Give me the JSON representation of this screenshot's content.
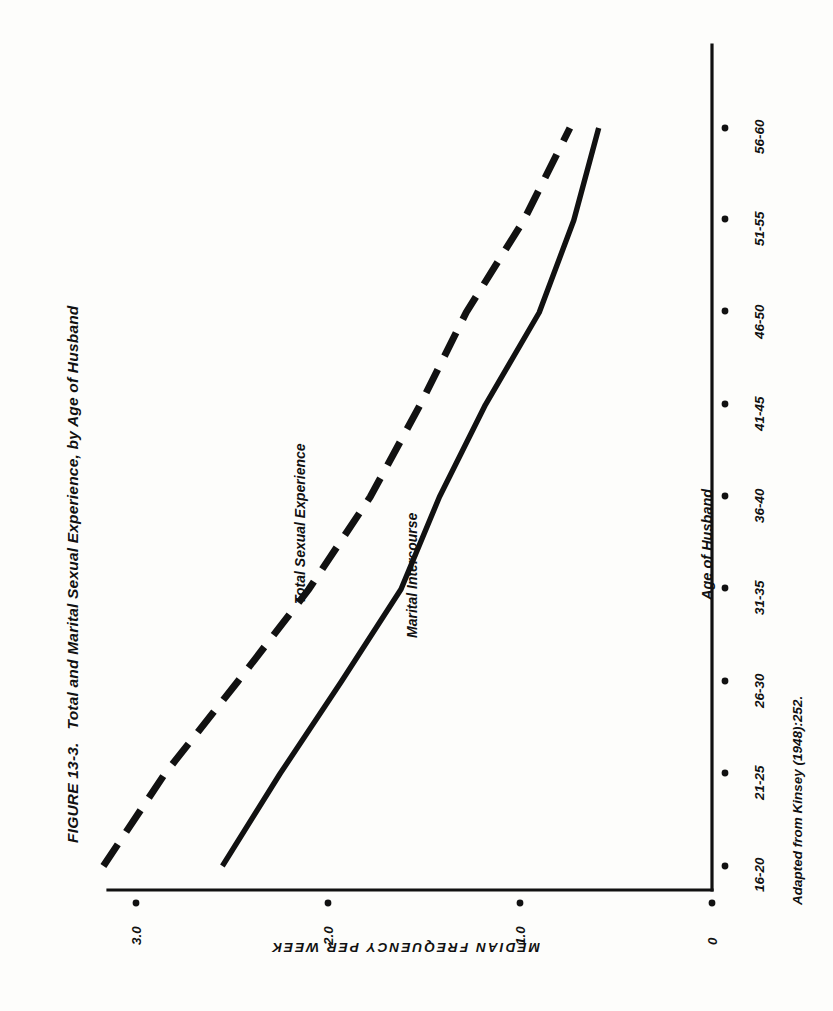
{
  "figure": {
    "number": "FIGURE 13-3.",
    "title": "Total and Marital Sexual Experience, by Age of Husband",
    "source_note": "Adapted from Kinsey (1948):252."
  },
  "axes": {
    "x_title": "Age of Husband",
    "y_title": "MEDIAN FREQUENCY PER WEEK",
    "y_ticks": [
      "0",
      "1.0",
      "2.0",
      "3.0"
    ],
    "x_ticks": [
      "16-20",
      "21-25",
      "26-30",
      "31-35",
      "36-40",
      "41-45",
      "46-50",
      "51-55",
      "56-60"
    ]
  },
  "series_labels": {
    "total": "Total Sexual Experience",
    "marital": "Marital Intercourse"
  },
  "colors": {
    "ink": "#111111",
    "paper": "#fdfdfb"
  },
  "chart_data": {
    "type": "line",
    "title": "Total and Marital Sexual Experience, by Age of Husband",
    "xlabel": "Age of Husband",
    "ylabel": "MEDIAN FREQUENCY PER WEEK",
    "categories": [
      "16-20",
      "21-25",
      "26-30",
      "31-35",
      "36-40",
      "41-45",
      "46-50",
      "51-55",
      "56-60"
    ],
    "ylim": [
      0,
      3.4
    ],
    "yticks": [
      0,
      1.0,
      2.0,
      3.0
    ],
    "grid": false,
    "legend": "inline-annotations",
    "orientation": "rotated-90ccw",
    "series": [
      {
        "name": "Total Sexual Experience",
        "style": "dashed",
        "values": [
          3.17,
          2.85,
          2.47,
          2.1,
          1.78,
          1.52,
          1.28,
          0.98,
          0.74
        ]
      },
      {
        "name": "Marital Intercourse",
        "style": "solid",
        "values": [
          2.55,
          2.25,
          1.93,
          1.62,
          1.42,
          1.18,
          0.9,
          0.72,
          0.59
        ]
      }
    ]
  }
}
